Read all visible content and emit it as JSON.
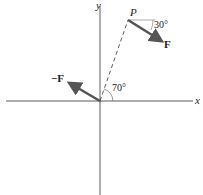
{
  "diagram": {
    "axes": {
      "x_label": "x",
      "y_label": "y"
    },
    "point_label": "P",
    "force_label": "F",
    "neg_force_label": "−F",
    "angle_force": "30°",
    "angle_position": "70°",
    "colors": {
      "arrow": "#555555",
      "axis": "#333333",
      "dash": "#333333"
    }
  }
}
